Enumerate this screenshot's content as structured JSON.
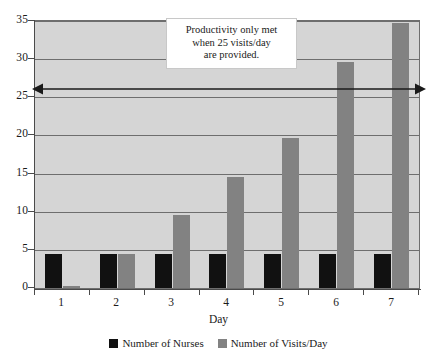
{
  "chart_data": {
    "type": "bar",
    "title": "",
    "xlabel": "Day",
    "ylabel": "",
    "categories": [
      "1",
      "2",
      "3",
      "4",
      "5",
      "6",
      "7"
    ],
    "series": [
      {
        "name": "Number of Nurses",
        "color": "#111111",
        "values": [
          4.4,
          4.4,
          4.4,
          4.4,
          4.4,
          4.4,
          4.4
        ]
      },
      {
        "name": "Number of Visits/Day",
        "color": "#828282",
        "values": [
          0.3,
          4.4,
          9.6,
          14.6,
          19.6,
          29.6,
          34.7
        ]
      }
    ],
    "ylim": [
      0,
      35
    ],
    "ytick_labels": [
      "35",
      "30",
      "25",
      "20",
      "15",
      "10",
      "5",
      "0"
    ],
    "ytick_values": [
      35,
      30,
      25,
      20,
      15,
      10,
      5,
      0
    ],
    "grid": true,
    "legend_position": "bottom",
    "annotations": [
      {
        "name": "productivity-note",
        "text_lines": [
          "Productivity only met",
          "when 25 visits/day",
          "are provided."
        ]
      },
      {
        "name": "target-line-arrow",
        "value": 25,
        "description": "double-headed horizontal arrow at 25 visits/day"
      }
    ],
    "plot_background": "#d5d5d5",
    "gridline_color": "#6e6e6e"
  },
  "axis": {
    "x_title": "Day"
  },
  "legend": {
    "items": [
      {
        "label": "Number of Nurses"
      },
      {
        "label": "Number of Visits/Day"
      }
    ]
  }
}
